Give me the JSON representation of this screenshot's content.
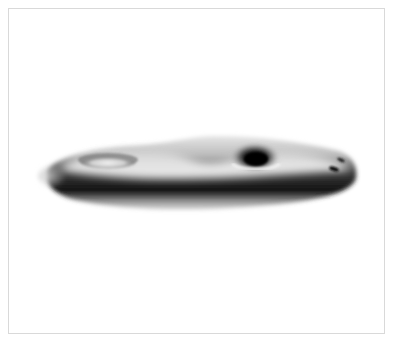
{
  "image": {
    "subject": "rendered-3d-surface",
    "description": "Grayscale shaded 3D render of an elongated flat surface with three holes (genus-3 surface) viewed at a low oblique angle",
    "frame": {
      "border_color": "#d9d9d9",
      "background": "#ffffff"
    },
    "surface": {
      "holes": [
        {
          "name": "left-hole",
          "cx": 108,
          "cy": 160
        },
        {
          "name": "middle-hole",
          "cx": 255,
          "cy": 157
        },
        {
          "name": "right-small-holes",
          "cx": 335,
          "cy": 165
        }
      ],
      "colors": {
        "highlight": "#ffffff",
        "mid": "#8a8a8a",
        "shadow": "#0a0a0a"
      }
    }
  }
}
